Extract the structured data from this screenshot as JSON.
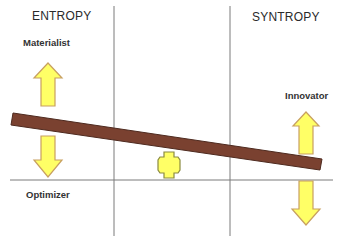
{
  "diagram": {
    "headings": {
      "left": "ENTROPY",
      "right": "SYNTROPY"
    },
    "labels": {
      "materialist": "Materialist",
      "optimizer": "Optimizer",
      "innovator": "Innovator"
    },
    "elements": {
      "seesaw_bar": "brown tilted plank (high on left, low on right)",
      "fulcrum": "yellow cross-shaped fulcrum",
      "arrows": [
        {
          "position": "left-top",
          "direction": "up",
          "label": "Materialist"
        },
        {
          "position": "left-bottom",
          "direction": "down",
          "label": "Optimizer"
        },
        {
          "position": "right-top",
          "direction": "up",
          "label": "Innovator"
        },
        {
          "position": "right-bottom",
          "direction": "down",
          "label": ""
        }
      ]
    },
    "colors": {
      "bar_fill": "#7a4130",
      "bar_stroke": "#4e2a1f",
      "arrow_fill": "#ffff66",
      "arrow_stroke": "#c8a060",
      "grid_line": "#7a7a7a"
    }
  }
}
